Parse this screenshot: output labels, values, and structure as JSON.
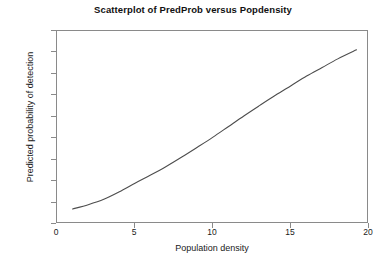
{
  "chart_data": {
    "type": "line",
    "title": "Scatterplot of PredProb versus Popdensity",
    "xlabel": "Population density",
    "ylabel": "Predicted probability of detection",
    "xlim": [
      0,
      20
    ],
    "ylim": [
      0.0,
      0.9
    ],
    "grid": false,
    "legend": null,
    "xticks": [
      "0",
      "5",
      "10",
      "15",
      "20"
    ],
    "xtick_values": [
      0,
      5,
      10,
      15,
      20
    ],
    "yticks": [
      "0.0",
      "0.1",
      "0.2",
      "0.3",
      "0.4",
      "0.5",
      "0.6",
      "0.7",
      "0.8",
      "0.9"
    ],
    "ytick_values": [
      0.0,
      0.1,
      0.2,
      0.3,
      0.4,
      0.5,
      0.6,
      0.7,
      0.8,
      0.9
    ],
    "line_color": "#4d4d4d",
    "frame_color": "#8a8a8a",
    "series": [
      {
        "name": "PredProb",
        "x": [
          1.0,
          2.0,
          3.0,
          4.0,
          5.0,
          6.0,
          7.0,
          8.0,
          9.0,
          10.0,
          11.0,
          12.0,
          13.0,
          14.0,
          15.0,
          16.0,
          17.0,
          18.0,
          19.2
        ],
        "values": [
          0.07,
          0.09,
          0.115,
          0.15,
          0.19,
          0.228,
          0.268,
          0.312,
          0.358,
          0.405,
          0.455,
          0.505,
          0.553,
          0.6,
          0.645,
          0.69,
          0.73,
          0.77,
          0.812
        ]
      }
    ]
  }
}
